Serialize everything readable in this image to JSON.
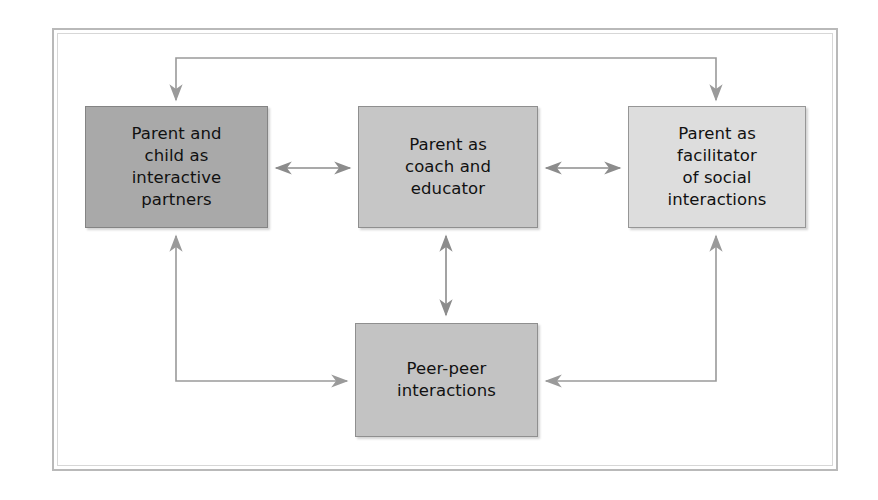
{
  "figure": {
    "type": "flow-diagram",
    "title": "",
    "background_color": "#ffffff",
    "frame": {
      "outer_border_color": "#b9b9b9",
      "inner_border_color": "#d7d7d7"
    }
  },
  "nodes": [
    {
      "id": "parent-child",
      "label": "Parent and\nchild as\ninteractive\npartners",
      "fill": "#a9a9a9",
      "border": "#848484"
    },
    {
      "id": "coach",
      "label": "Parent as\ncoach and\neducator",
      "fill": "#c6c6c6",
      "border": "#8f8f8f"
    },
    {
      "id": "facilitator",
      "label": "Parent as\nfacilitator\nof social\ninteractions",
      "fill": "#dddddd",
      "border": "#969696"
    },
    {
      "id": "peer",
      "label": "Peer-peer\ninteractions",
      "fill": "#c3c3c3",
      "border": "#8f8f8f"
    }
  ],
  "connectors": [
    {
      "id": "top-bracket",
      "from": "parent-child",
      "to": "facilitator",
      "shape": "bracket-over-top",
      "arrowheads": "both-ends-down",
      "color": "#9a9a9a"
    },
    {
      "id": "parent-child-to-coach",
      "from": "parent-child",
      "to": "coach",
      "shape": "horizontal",
      "arrowheads": "both",
      "color": "#8c8c8c"
    },
    {
      "id": "coach-to-facilitator",
      "from": "coach",
      "to": "facilitator",
      "shape": "horizontal",
      "arrowheads": "both",
      "color": "#8c8c8c"
    },
    {
      "id": "coach-to-peer",
      "from": "coach",
      "to": "peer",
      "shape": "vertical",
      "arrowheads": "both",
      "color": "#8c8c8c"
    },
    {
      "id": "peer-to-parent-child",
      "from": "peer",
      "to": "parent-child",
      "shape": "elbow-left",
      "arrowheads": "both",
      "color": "#9a9a9a"
    },
    {
      "id": "facilitator-to-peer",
      "from": "facilitator",
      "to": "peer",
      "shape": "elbow-right",
      "arrowheads": "both",
      "color": "#9a9a9a"
    }
  ]
}
